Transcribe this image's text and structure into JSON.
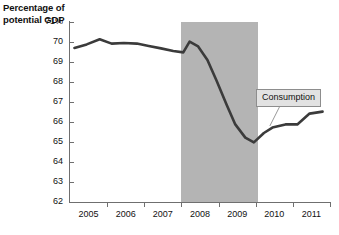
{
  "chart_data": {
    "type": "line",
    "title": "",
    "axis_title_lines": [
      "Percentage of",
      "potential GDP"
    ],
    "ylabel": "Percentage of potential GDP",
    "xlabel": "",
    "ylim": [
      62,
      71
    ],
    "xlim": [
      2004.5,
      2011.5
    ],
    "grid": false,
    "y_ticks": [
      {
        "value": 71,
        "label": "71%"
      },
      {
        "value": 70,
        "label": "70"
      },
      {
        "value": 69,
        "label": "69"
      },
      {
        "value": 68,
        "label": "68"
      },
      {
        "value": 67,
        "label": "67"
      },
      {
        "value": 66,
        "label": "66"
      },
      {
        "value": 65,
        "label": "65"
      },
      {
        "value": 64,
        "label": "64"
      },
      {
        "value": 63,
        "label": "63"
      },
      {
        "value": 62,
        "label": "62"
      }
    ],
    "x_ticks": [
      {
        "value": 2005,
        "label": "2005"
      },
      {
        "value": 2006,
        "label": "2006"
      },
      {
        "value": 2007,
        "label": "2007"
      },
      {
        "value": 2008,
        "label": "2008"
      },
      {
        "value": 2009,
        "label": "2009"
      },
      {
        "value": 2010,
        "label": "2010"
      },
      {
        "value": 2011,
        "label": "2011"
      }
    ],
    "x_tick_marks": [
      2004.5,
      2005.5,
      2006.5,
      2007.5,
      2008.5,
      2009.5,
      2010.5,
      2011.5
    ],
    "shaded_region": {
      "label": "recession-band",
      "x_start": 2007.5,
      "x_end": 2009.55,
      "color": "#b4b4b4"
    },
    "series": [
      {
        "name": "Consumption",
        "color": "#3b3b3b",
        "line_width": 2.6,
        "x": [
          2004.62,
          2004.95,
          2005.3,
          2005.62,
          2005.95,
          2006.3,
          2006.62,
          2006.95,
          2007.28,
          2007.55,
          2007.72,
          2007.95,
          2008.2,
          2008.45,
          2008.72,
          2008.95,
          2009.22,
          2009.45,
          2009.72,
          2009.95,
          2010.3,
          2010.62,
          2010.95,
          2011.3
        ],
        "y": [
          69.7,
          69.88,
          70.14,
          69.92,
          69.95,
          69.92,
          69.8,
          69.68,
          69.55,
          69.48,
          70.02,
          69.78,
          69.1,
          68.05,
          66.85,
          65.88,
          65.22,
          64.98,
          65.45,
          65.72,
          65.88,
          65.88,
          66.42,
          66.52
        ]
      }
    ],
    "annotations": [
      {
        "name": "consumption-callout",
        "text": "Consumption",
        "box_color": "#e2e2e2",
        "border_color": "#8d8d8d",
        "leader_line": {
          "color": "#9a9a9a",
          "from_x": 2010.22,
          "from_y": 67.05,
          "to_x": 2009.88,
          "to_y": 65.8
        }
      }
    ]
  },
  "colors": {
    "background": "#ffffff",
    "axis": "#6f6f6f",
    "text": "#111111",
    "line": "#3b3b3b",
    "band": "#b4b4b4"
  }
}
